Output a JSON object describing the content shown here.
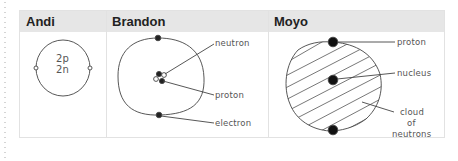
{
  "table": {
    "columns": [
      {
        "header": "Andi"
      },
      {
        "header": "Brandon"
      },
      {
        "header": "Moyo"
      }
    ]
  },
  "andi": {
    "center_label_line1": "2p",
    "center_label_line2": "2n",
    "electron_label": "e"
  },
  "brandon": {
    "labels": [
      "neutron",
      "proton",
      "electron"
    ]
  },
  "moyo": {
    "labels": [
      "proton",
      "nucleus",
      "cloud",
      "of",
      "neutrons"
    ]
  },
  "colors": {
    "header_bg": "#e6e6e6",
    "border": "#e2e2e2",
    "ink": "#333333"
  }
}
